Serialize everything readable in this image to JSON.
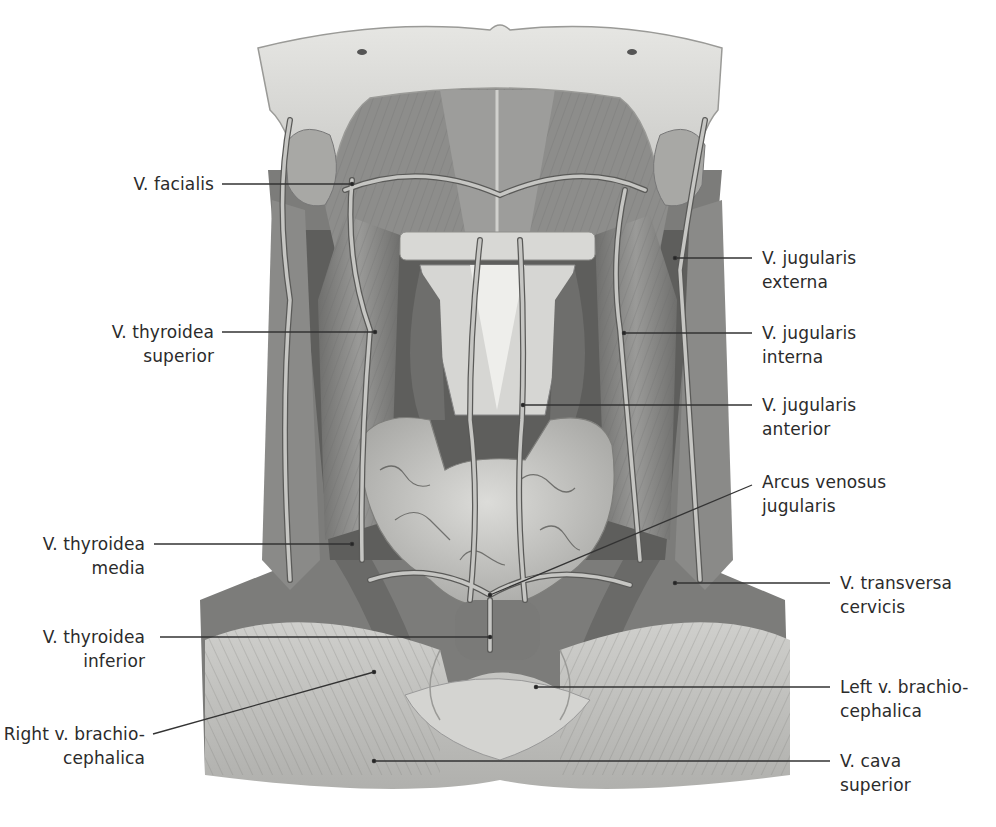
{
  "figure": {
    "colors": {
      "background": "#ffffff",
      "text": "#2b2b2b",
      "leader": "#333333",
      "mandible": "#d9d9d6",
      "muscle": "#8a8a88",
      "muscle_dark": "#5d5d5b",
      "vein": "#b8b8b5",
      "thyroid": "#c9c9c6",
      "clavicle_region": "#c4c4c1"
    }
  },
  "labels": {
    "v_facialis": {
      "line1": "V. facialis",
      "line2": ""
    },
    "v_thyroidea_superior": {
      "line1": "V. thyroidea",
      "line2": "superior"
    },
    "v_thyroidea_media": {
      "line1": "V. thyroidea",
      "line2": "media"
    },
    "v_thyroidea_inferior": {
      "line1": "V. thyroidea",
      "line2": "inferior"
    },
    "right_v_brachiocephalica": {
      "line1": "Right v. brachio-",
      "line2": "cephalica"
    },
    "v_jugularis_externa": {
      "line1": "V. jugularis",
      "line2": "externa"
    },
    "v_jugularis_interna": {
      "line1": "V. jugularis",
      "line2": "interna"
    },
    "v_jugularis_anterior": {
      "line1": "V. jugularis",
      "line2": "anterior"
    },
    "arcus_venosus_jugularis": {
      "line1": "Arcus venosus",
      "line2": "jugularis"
    },
    "v_transversa_cervicis": {
      "line1": "V. transversa",
      "line2": "cervicis"
    },
    "left_v_brachiocephalica": {
      "line1": "Left v. brachio-",
      "line2": "cephalica"
    },
    "v_cava_superior": {
      "line1": "V. cava",
      "line2": "superior"
    }
  }
}
